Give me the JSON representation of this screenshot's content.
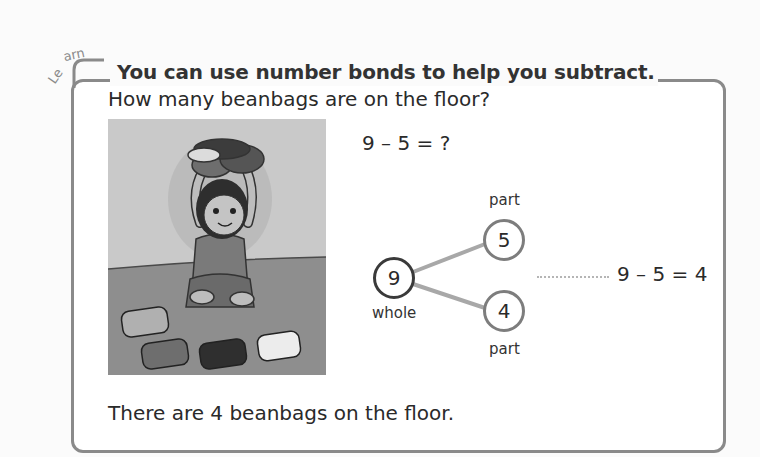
{
  "learn_box": {
    "tag": "Learn",
    "title": "You can use number bonds to help you subtract.",
    "question": "How many beanbags are on the floor?",
    "picture": {
      "description": "Girl kneeling on floor holding beanbags above her head, with 4 beanbags on the floor",
      "beanbags_on_floor": 4
    },
    "equation_question": "9 – 5 = ?",
    "number_bond": {
      "whole": {
        "value": "9",
        "label": "whole"
      },
      "parts": [
        {
          "value": "5",
          "label": "part"
        },
        {
          "value": "4",
          "label": "part"
        }
      ]
    },
    "equation_answer": "9 – 5 = 4",
    "answer_sentence": "There are 4 beanbags on the floor."
  },
  "colors": {
    "frame": "#8a8a8a",
    "text": "#2a2a2a",
    "whole_circle": "#3a3a3a",
    "part_circle": "#7d7d7d",
    "connector": "#a8a8a8",
    "dotted_leader": "#b5b5b5"
  }
}
